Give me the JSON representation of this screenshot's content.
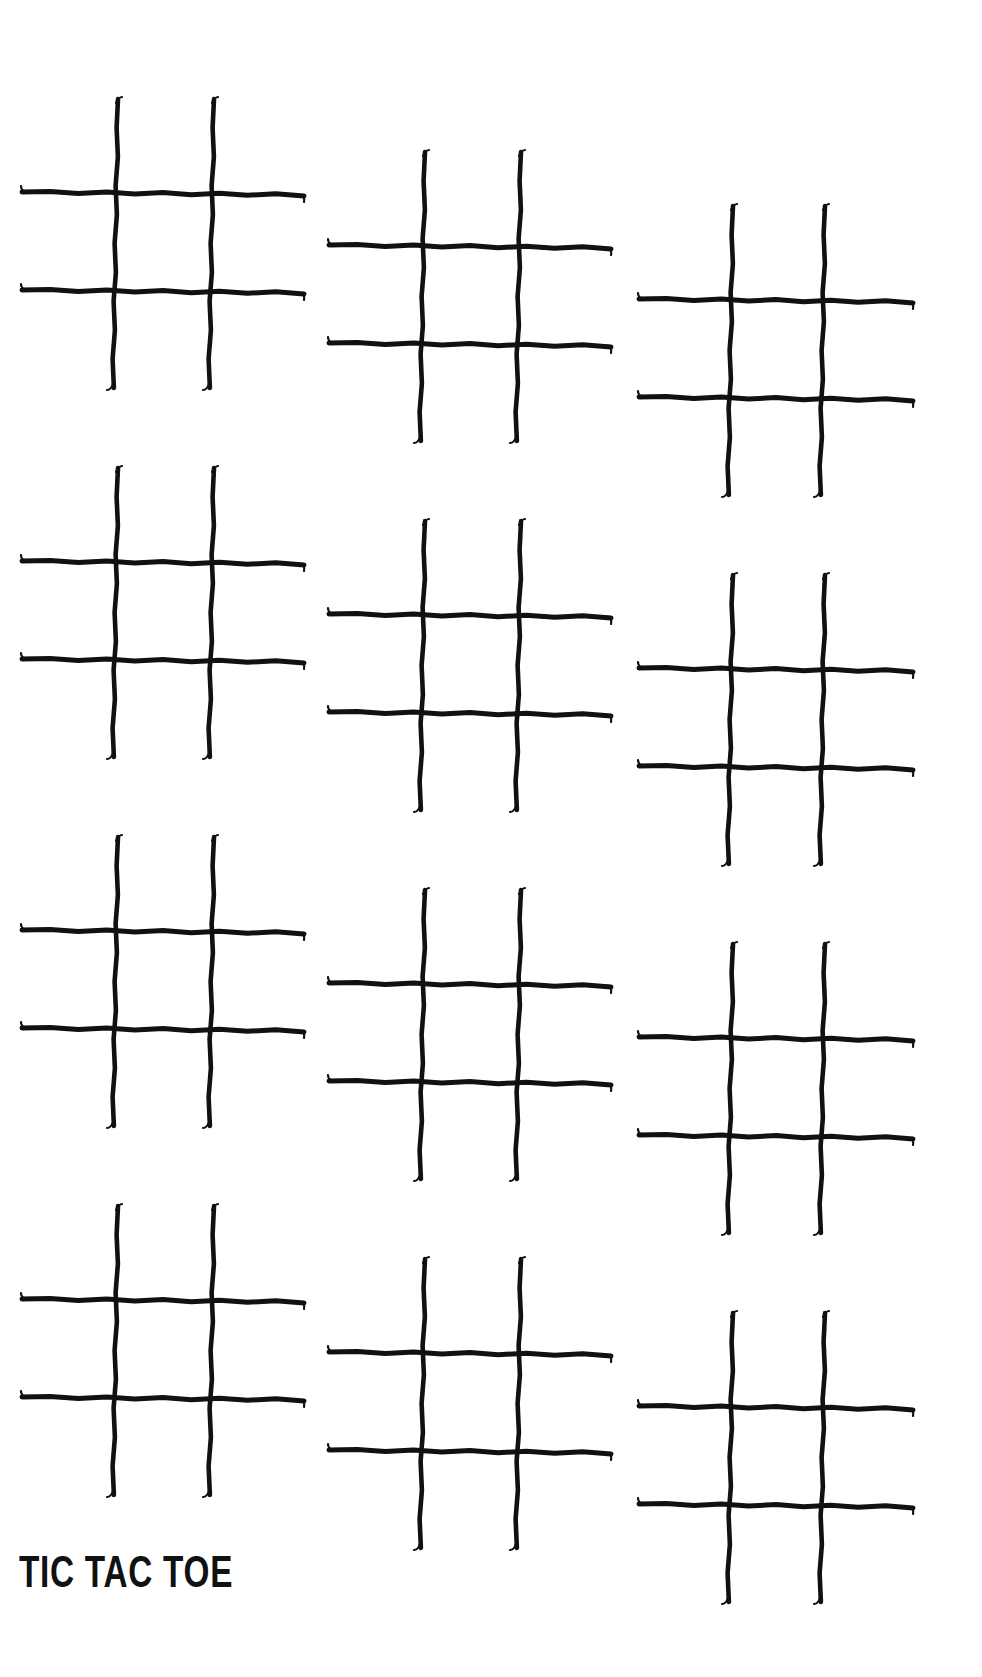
{
  "page": {
    "title": "TIC TAC TOE",
    "background_color": "#ffffff",
    "ink_color": "#111111"
  },
  "worksheet": {
    "columns": 3,
    "rows": 4,
    "board_count": 12,
    "board_icon": "hash-grid-icon",
    "boards": [
      {
        "id": "board-r1-c1",
        "row": 1,
        "col": 1,
        "left": 20,
        "top": 97,
        "width": 286
      },
      {
        "id": "board-r1-c2",
        "row": 1,
        "col": 2,
        "left": 327,
        "top": 150,
        "width": 286
      },
      {
        "id": "board-r1-c3",
        "row": 1,
        "col": 3,
        "left": 637,
        "top": 204,
        "width": 278
      },
      {
        "id": "board-r2-c1",
        "row": 2,
        "col": 1,
        "left": 20,
        "top": 466,
        "width": 286
      },
      {
        "id": "board-r2-c2",
        "row": 2,
        "col": 2,
        "left": 327,
        "top": 519,
        "width": 286
      },
      {
        "id": "board-r2-c3",
        "row": 2,
        "col": 3,
        "left": 637,
        "top": 573,
        "width": 278
      },
      {
        "id": "board-r3-c1",
        "row": 3,
        "col": 1,
        "left": 20,
        "top": 835,
        "width": 286
      },
      {
        "id": "board-r3-c2",
        "row": 3,
        "col": 2,
        "left": 327,
        "top": 888,
        "width": 286
      },
      {
        "id": "board-r3-c3",
        "row": 3,
        "col": 3,
        "left": 637,
        "top": 942,
        "width": 278
      },
      {
        "id": "board-r4-c1",
        "row": 4,
        "col": 1,
        "left": 20,
        "top": 1204,
        "width": 286
      },
      {
        "id": "board-r4-c2",
        "row": 4,
        "col": 2,
        "left": 327,
        "top": 1257,
        "width": 286
      },
      {
        "id": "board-r4-c3",
        "row": 4,
        "col": 3,
        "left": 637,
        "top": 1311,
        "width": 278
      }
    ]
  }
}
